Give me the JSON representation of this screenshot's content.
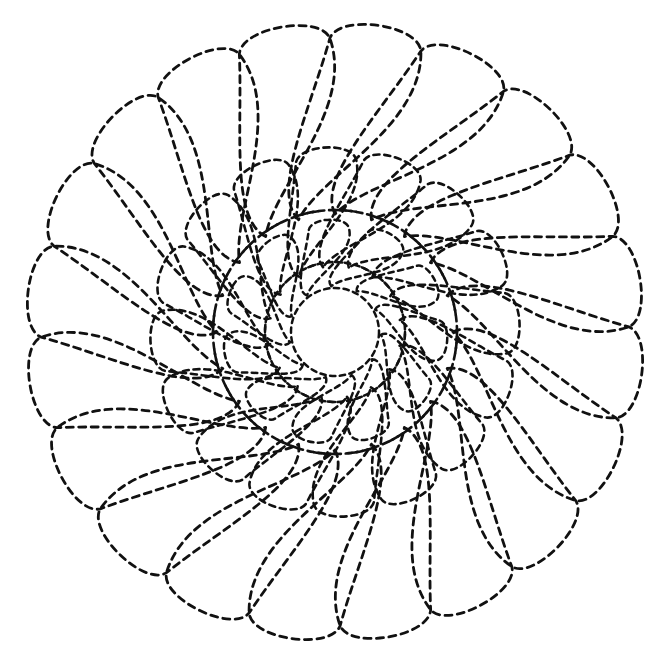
{
  "document": {
    "title": "Feathered Rose Quilting Stencil",
    "subject": "feather-wreath-pattern",
    "medium": "dashed stitch line drawing",
    "background_color": "#ffffff",
    "stroke_color": "#111111"
  },
  "canvas": {
    "width": 661,
    "height": 659,
    "center_x": 335,
    "center_y": 332
  },
  "stitch_line": {
    "style": "dashed",
    "dash_length_px": 7,
    "gap_length_px": 5,
    "stroke_width_px": 2.8,
    "linecap": "round"
  },
  "chart_data": {
    "type": "diagram",
    "rings": [
      {
        "name": "outer-plume-ring",
        "count": 20,
        "start_angle_deg": -90,
        "inner_radius": 118,
        "outer_radius": 300,
        "tip_width": 62,
        "spiral_offset_deg": 26,
        "sweep_deg": 18
      },
      {
        "name": "middle-plume-ring",
        "count": 16,
        "start_angle_deg": -78,
        "inner_radius": 66,
        "outer_radius": 178,
        "tip_width": 44,
        "spiral_offset_deg": 30,
        "sweep_deg": 20
      },
      {
        "name": "inner-plume-ring",
        "count": 11,
        "start_angle_deg": -62,
        "inner_radius": 46,
        "outer_radius": 108,
        "tip_width": 30,
        "spiral_offset_deg": 34,
        "sweep_deg": 22
      }
    ],
    "center_circle": {
      "name": "open-center",
      "radius": 44,
      "cx": 335,
      "cy": 332
    },
    "spine_arcs": [
      {
        "name": "outer-spine",
        "radius": 122,
        "count": 20
      },
      {
        "name": "middle-spine",
        "radius": 70,
        "count": 16
      }
    ]
  }
}
